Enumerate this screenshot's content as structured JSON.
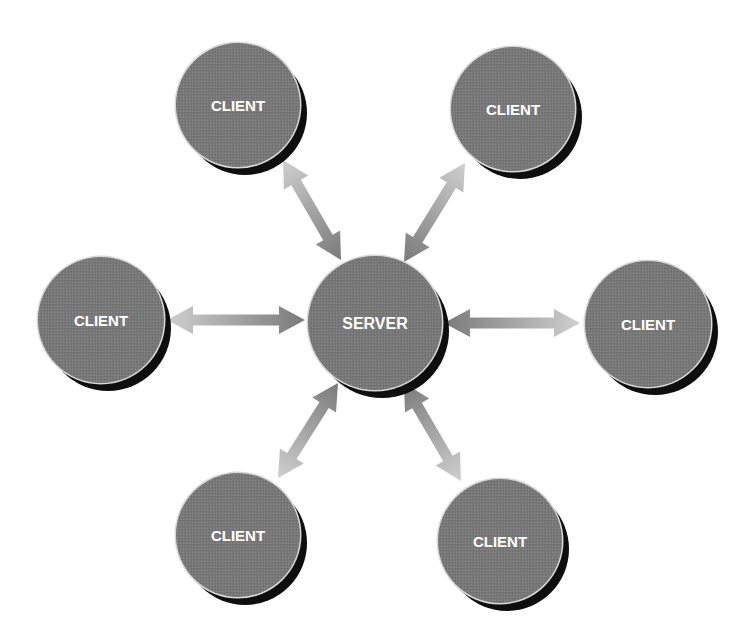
{
  "diagram": {
    "type": "client-server star topology",
    "colors": {
      "node_fill": "#747474",
      "node_rim": "#d8d8d8",
      "node_shadow": "#0e0e0e",
      "label": "#ffffff",
      "arrow_light": "#cfcfcf",
      "arrow_dark": "#7a7a7a",
      "background": "#ffffff"
    },
    "server": {
      "label": "SERVER",
      "cx": 375,
      "cy": 323,
      "r": 67
    },
    "clients": [
      {
        "id": "client-top-left",
        "label": "CLIENT",
        "cx": 238,
        "cy": 105,
        "r": 62
      },
      {
        "id": "client-top-right",
        "label": "CLIENT",
        "cx": 513,
        "cy": 109,
        "r": 62
      },
      {
        "id": "client-left",
        "label": "CLIENT",
        "cx": 101,
        "cy": 320,
        "r": 63
      },
      {
        "id": "client-right",
        "label": "CLIENT",
        "cx": 648,
        "cy": 324,
        "r": 63
      },
      {
        "id": "client-bottom-left",
        "label": "CLIENT",
        "cx": 238,
        "cy": 535,
        "r": 62
      },
      {
        "id": "client-bottom-right",
        "label": "CLIENT",
        "cx": 500,
        "cy": 541,
        "r": 62
      }
    ],
    "connections": [
      {
        "from": "client-top-left",
        "to": "server",
        "x1": 283,
        "y1": 160,
        "x2": 341,
        "y2": 260,
        "bidirectional": true
      },
      {
        "from": "client-top-right",
        "to": "server",
        "x1": 465,
        "y1": 163,
        "x2": 404,
        "y2": 262,
        "bidirectional": true
      },
      {
        "from": "client-left",
        "to": "server",
        "x1": 167,
        "y1": 320,
        "x2": 305,
        "y2": 320,
        "bidirectional": true
      },
      {
        "from": "client-right",
        "to": "server",
        "x1": 580,
        "y1": 323,
        "x2": 444,
        "y2": 323,
        "bidirectional": true
      },
      {
        "from": "client-bottom-left",
        "to": "server",
        "x1": 278,
        "y1": 478,
        "x2": 338,
        "y2": 383,
        "bidirectional": true
      },
      {
        "from": "client-bottom-right",
        "to": "server",
        "x1": 461,
        "y1": 481,
        "x2": 404,
        "y2": 383,
        "bidirectional": true
      }
    ]
  }
}
